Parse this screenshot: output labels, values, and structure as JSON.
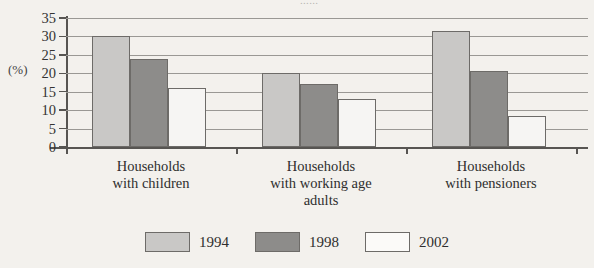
{
  "chart_data": {
    "type": "bar",
    "title": "",
    "xlabel": "",
    "ylabel": "(%)",
    "ylim": [
      0,
      35
    ],
    "ytick_step": 5,
    "yticks": [
      0,
      5,
      10,
      15,
      20,
      25,
      30,
      35
    ],
    "grid": true,
    "legend_position": "bottom-center",
    "categories": [
      "Households\nwith children",
      "Households\nwith working age\nadults",
      "Households\nwith pensioners"
    ],
    "series": [
      {
        "name": "1994",
        "color": "#c9c8c6",
        "values": [
          30,
          20,
          31.5
        ]
      },
      {
        "name": "1998",
        "color": "#8d8c8a",
        "values": [
          24,
          17,
          20.5
        ]
      },
      {
        "name": "2002",
        "color": "#f6f5f3",
        "values": [
          16,
          13,
          8.5
        ]
      }
    ]
  },
  "axis": {
    "y_title": "(%)"
  },
  "legend": {
    "items": [
      {
        "label": "1994",
        "swatch": "light-gray-swatch"
      },
      {
        "label": "1998",
        "swatch": "dark-gray-swatch"
      },
      {
        "label": "2002",
        "swatch": "white-swatch"
      }
    ]
  },
  "title_sliver": "......"
}
